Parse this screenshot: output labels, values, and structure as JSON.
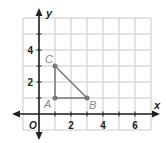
{
  "chart_data": {
    "type": "scatter",
    "title": "",
    "xlabel": "x",
    "ylabel": "y",
    "origin_label": "O",
    "xlim": [
      -1,
      7
    ],
    "ylim": [
      -1,
      6
    ],
    "grid": true,
    "x_ticks": [
      "2",
      "4",
      "6"
    ],
    "y_ticks": [
      "2",
      "4"
    ],
    "points": [
      {
        "label": "A",
        "x": 1,
        "y": 1
      },
      {
        "label": "B",
        "x": 3,
        "y": 1
      },
      {
        "label": "C",
        "x": 1,
        "y": 3
      }
    ],
    "polygon": [
      "A",
      "B",
      "C"
    ]
  },
  "colors": {
    "grid": "#c8c8c8",
    "axis": "#222222",
    "triangle": "#777777",
    "point_label": "#888888",
    "tick_label": "#222222"
  }
}
